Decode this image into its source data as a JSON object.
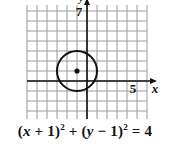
{
  "diagram": {
    "type": "coordinate-plane-circle",
    "grid": {
      "x_min": -6,
      "x_max": 6,
      "y_min": -4,
      "y_max": 8,
      "cell_px": 10,
      "origin_px": [
        87,
        81
      ],
      "left_px": 27,
      "top_px": 5,
      "right_px": 147,
      "bottom_px": 119,
      "line_color": "#9a9a9a",
      "axis_color": "#111111"
    },
    "axes": {
      "x_label": "x",
      "y_label": "y",
      "x_tick_label": "5",
      "x_tick_value": 5,
      "y_tick_label": "7",
      "y_tick_value": 7
    },
    "circle": {
      "center": [
        -1,
        1
      ],
      "radius": 2,
      "stroke_color": "#111111"
    },
    "center_point": [
      -1,
      1
    ]
  },
  "equation": {
    "text": "(x + 1)² + (y − 1)² = 4",
    "parts": {
      "open1": "(",
      "var1": "x",
      "rest1": " + 1)",
      "exp1": "2",
      "plus": " + (",
      "var2": "y",
      "rest2": " − 1)",
      "exp2": "2",
      "equals": " = 4"
    }
  }
}
